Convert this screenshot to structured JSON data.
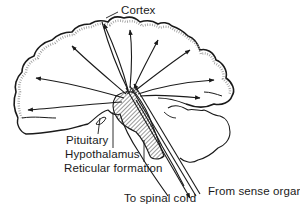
{
  "figure": {
    "labels": {
      "cortex": "Cortex",
      "pituitary": "Pituitary",
      "hypothalamus": "Hypothalamus",
      "reticular_formation": "Reticular formation",
      "to_spinal_cord": "To spinal cord",
      "from_sense_organ": "From sense organ"
    },
    "colors": {
      "ink": "#1a1a1a",
      "background": "#ffffff",
      "stipple": "#8a8a8a"
    }
  }
}
